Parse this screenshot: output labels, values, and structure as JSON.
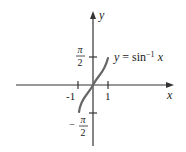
{
  "diagram": {
    "equation_label": {
      "lhs": "y",
      "eq": " = sin",
      "sup": "−1",
      "rhs": " x"
    },
    "axes": {
      "x_label": "x",
      "y_label": "y",
      "x_ticks": [
        {
          "label": "-1"
        },
        {
          "label": "1"
        }
      ],
      "y_ticks": [
        {
          "num": "π",
          "den": "2",
          "sign": ""
        },
        {
          "num": "π",
          "den": "2",
          "sign": "−"
        }
      ]
    },
    "colors": {
      "axis": "#333333",
      "curve": "#666666",
      "text": "#222222"
    }
  }
}
